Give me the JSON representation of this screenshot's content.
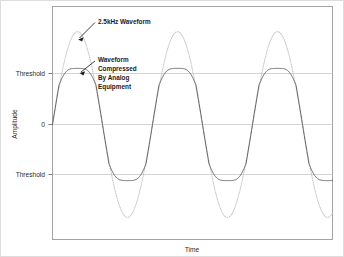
{
  "figure": {
    "background_color": "#ffffff",
    "outer_border_color": "#d8d8d8",
    "plot_border_color": "#9a9a9a",
    "grid_color": "#cfcfcf",
    "sine_color": "#c9c9c9",
    "compressed_color": "#5a5a5a",
    "text_color": "#2b2b2b"
  },
  "axes": {
    "y_axis_title": "Amplitude",
    "x_axis_title": "Time",
    "y_tick_labels": [
      {
        "label": "Threshold",
        "value": 1
      },
      {
        "label": "0",
        "value": 0
      },
      {
        "label": "Threshold",
        "value": -1
      }
    ],
    "grid": "horizontal"
  },
  "annotations": [
    {
      "name": "sine-label",
      "text": "2.5kHz Waveform",
      "lines": [
        "2.5kHz Waveform"
      ]
    },
    {
      "name": "compressed-label",
      "text": "Waveform Compressed By Analog Equipment",
      "lines": [
        "Waveform",
        "Compressed",
        "By Analog",
        "Equipment"
      ]
    }
  ],
  "chart_data": {
    "type": "line",
    "title": "",
    "xlabel": "Time",
    "ylabel": "Amplitude",
    "xlim": [
      0,
      2.8
    ],
    "ylim": [
      -2.0,
      2.0
    ],
    "grid": true,
    "legend": "none",
    "ytick_values": [
      1,
      0,
      -1
    ],
    "ytick_labels": [
      "Threshold",
      "0",
      "Threshold"
    ],
    "annotations": [
      {
        "text": "2.5kHz Waveform",
        "points_to": "sine-peak-1"
      },
      {
        "text": "Waveform Compressed By Analog Equipment",
        "points_to": "compressed-peak-1"
      }
    ],
    "series": [
      {
        "name": "2.5kHz Waveform",
        "style": "dotted",
        "color": "#c9c9c9",
        "description": "Pure sine wave, amplitude 1.82, frequency 2.5 kHz, 2.8 cycles shown",
        "amplitude": 1.82,
        "cycles": 2.8,
        "phase": 0
      },
      {
        "name": "Waveform Compressed By Analog Equipment",
        "style": "solid",
        "color": "#5a5a5a",
        "description": "Same sine wave soft-clipped at the threshold levels (+/-1), flat-topped with slight dome overshoot and steep linear transitions",
        "clip_level": 1.0,
        "overshoot": 0.1
      }
    ]
  }
}
